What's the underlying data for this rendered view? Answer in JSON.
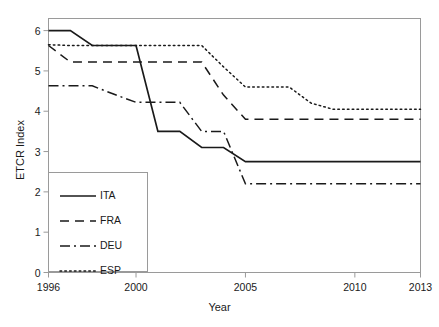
{
  "chart_data": {
    "type": "line",
    "title": "",
    "xlabel": "Year",
    "ylabel": "ETCR Index",
    "xlim": [
      1996,
      2013
    ],
    "ylim": [
      0,
      6.3
    ],
    "grid": false,
    "legend_position": "lower-left",
    "xticks": [
      1996,
      2000,
      2005,
      2010,
      2013
    ],
    "xtick_labels": [
      "1996",
      "2000",
      "2005",
      "2010",
      "2013"
    ],
    "yticks": [
      0,
      1,
      2,
      3,
      4,
      5,
      6
    ],
    "ytick_labels": [
      "0",
      "1",
      "2",
      "3",
      "4",
      "5",
      "6"
    ],
    "x": [
      1996,
      1997,
      1998,
      1999,
      2000,
      2001,
      2002,
      2003,
      2004,
      2005,
      2006,
      2007,
      2008,
      2009,
      2010,
      2011,
      2012,
      2013
    ],
    "series": [
      {
        "name": "ITA",
        "dash": "solid",
        "values": [
          6.0,
          6.0,
          5.63,
          5.63,
          5.63,
          3.5,
          3.5,
          3.1,
          3.1,
          2.75,
          2.75,
          2.75,
          2.75,
          2.75,
          2.75,
          2.75,
          2.75,
          2.75
        ]
      },
      {
        "name": "FRA",
        "dash": "dashed",
        "values": [
          5.63,
          5.22,
          5.22,
          5.22,
          5.22,
          5.22,
          5.22,
          5.22,
          4.4,
          3.8,
          3.8,
          3.8,
          3.8,
          3.8,
          3.8,
          3.8,
          3.8,
          3.8
        ]
      },
      {
        "name": "DEU",
        "dash": "dashdot",
        "values": [
          4.63,
          4.63,
          4.63,
          4.42,
          4.22,
          4.22,
          4.22,
          3.5,
          3.5,
          2.2,
          2.2,
          2.2,
          2.2,
          2.2,
          2.2,
          2.2,
          2.2,
          2.2
        ]
      },
      {
        "name": "ESP",
        "dash": "dotted",
        "values": [
          5.65,
          5.63,
          5.63,
          5.63,
          5.63,
          5.63,
          5.63,
          5.63,
          5.1,
          4.6,
          4.6,
          4.6,
          4.2,
          4.05,
          4.05,
          4.05,
          4.05,
          4.05
        ]
      }
    ]
  },
  "legend": {
    "items": [
      {
        "label": "ITA"
      },
      {
        "label": "FRA"
      },
      {
        "label": "DEU"
      },
      {
        "label": "ESP"
      }
    ]
  },
  "axes": {
    "x_title": "Year",
    "y_title": "ETCR Index"
  },
  "colors": {
    "line": "#1a1a1a",
    "frame": "#9a9a9a",
    "background": "#ffffff"
  }
}
